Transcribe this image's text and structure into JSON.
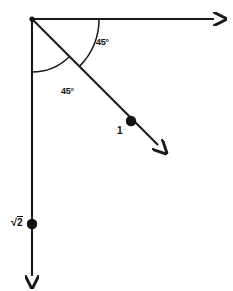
{
  "figure": {
    "background_color": "#ffffff",
    "stroke_color": "#1a1a1a",
    "text_color": "#111111"
  },
  "origin": {
    "x": 32,
    "y": 19,
    "label": ""
  },
  "rays": [
    {
      "name": "horizontal-ray",
      "from": [
        32,
        19
      ],
      "to": [
        222,
        19
      ],
      "direction": "right",
      "arrowhead": true
    },
    {
      "name": "vertical-ray",
      "from": [
        32,
        19
      ],
      "to": [
        32,
        285
      ],
      "direction": "down",
      "arrowhead": true
    },
    {
      "name": "diagonal-ray",
      "from": [
        32,
        19
      ],
      "to": [
        166,
        162
      ],
      "direction": "down-right",
      "angle_from_horizontal_deg": 45,
      "arrowhead": true
    }
  ],
  "arcs": [
    {
      "name": "upper-angle-arc",
      "center": [
        32,
        19
      ],
      "radius": 67,
      "start_deg": 0,
      "end_deg": 45,
      "between": [
        "horizontal-ray",
        "diagonal-ray"
      ]
    },
    {
      "name": "lower-angle-arc",
      "center": [
        32,
        19
      ],
      "radius": 53,
      "start_deg": 45,
      "end_deg": 90,
      "between": [
        "diagonal-ray",
        "vertical-ray"
      ]
    }
  ],
  "angle_labels": [
    {
      "name": "upper-angle-label",
      "text": "45°",
      "x": 96,
      "y": 42
    },
    {
      "name": "lower-angle-label",
      "text": "45°",
      "x": 61,
      "y": 91
    }
  ],
  "points": [
    {
      "name": "diagonal-magnitude-point",
      "x": 131,
      "y": 121,
      "radius": 5,
      "label": "1",
      "label_x": 117,
      "label_y": 128
    },
    {
      "name": "vertical-magnitude-point",
      "x": 32,
      "y": 224,
      "radius": 5,
      "label": "√2",
      "radical_sign": "√",
      "radicand": "2",
      "label_x": 12,
      "label_y": 218
    }
  ],
  "values": {
    "upper_angle": "45°",
    "lower_angle": "45°",
    "diagonal_magnitude": "1",
    "vertical_magnitude": "√2"
  }
}
